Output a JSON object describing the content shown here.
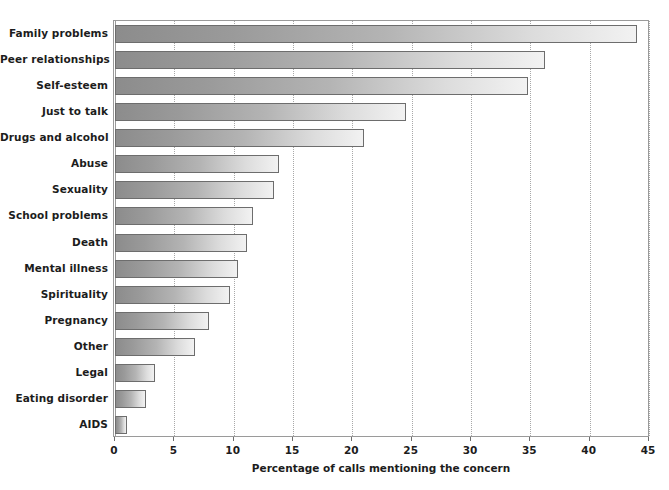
{
  "chart_data": {
    "type": "bar",
    "orientation": "horizontal",
    "title": "",
    "xlabel": "Percentage of calls mentioning the concern",
    "ylabel": "",
    "xlim": [
      0,
      45
    ],
    "ylim": null,
    "xticks": [
      0,
      5,
      10,
      15,
      20,
      25,
      30,
      35,
      40,
      45
    ],
    "xtick_labels": [
      "0",
      "5",
      "10",
      "15",
      "20",
      "25",
      "30",
      "35",
      "40",
      "45"
    ],
    "grid": "vertical-dotted",
    "legend": null,
    "categories": [
      "Family problems",
      "Peer relationships",
      "Self-esteem",
      "Just to talk",
      "Drugs and alcohol",
      "Abuse",
      "Sexuality",
      "School problems",
      "Death",
      "Mental illness",
      "Spirituality",
      "Pregnancy",
      "Other",
      "Legal",
      "Eating disorder",
      "AIDS"
    ],
    "values": [
      44.0,
      36.2,
      34.8,
      24.5,
      21.0,
      13.8,
      13.4,
      11.6,
      11.1,
      10.4,
      9.7,
      7.9,
      6.7,
      3.4,
      2.6,
      1.0
    ],
    "bar_fill": "linear-gradient-gray-dark-to-light",
    "bar_edge_color": "#6d6d6d",
    "background_color": "#ffffff"
  }
}
